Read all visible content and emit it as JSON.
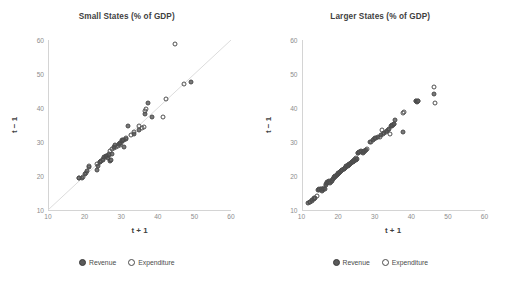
{
  "figure": {
    "panels": [
      {
        "id": "small-states",
        "title": "Small States (% of GDP)",
        "xlabel": "t + 1",
        "ylabel": "t − 1",
        "legend": [
          {
            "key": "revenue",
            "label": "Revenue",
            "marker": "filled-circle",
            "color": "#6d6d6d"
          },
          {
            "key": "expenditure",
            "label": "Expenditure",
            "marker": "open-circle",
            "color": "#4f4f4f"
          }
        ]
      },
      {
        "id": "larger-states",
        "title": "Larger States (% of GDP)",
        "xlabel": "t + 1",
        "ylabel": "t − 1",
        "legend": [
          {
            "key": "revenue",
            "label": "Revenue",
            "marker": "filled-circle",
            "color": "#6d6d6d"
          },
          {
            "key": "expenditure",
            "label": "Expenditure",
            "marker": "open-circle",
            "color": "#4f4f4f"
          }
        ]
      }
    ],
    "axis_ticks": {
      "x": [
        "10",
        "20",
        "30",
        "40",
        "50",
        "60"
      ],
      "y": [
        "10",
        "20",
        "30",
        "40",
        "50",
        "60"
      ]
    }
  },
  "chart_data": [
    {
      "type": "scatter",
      "title": "Small States (% of GDP)",
      "xlabel": "t + 1",
      "ylabel": "t − 1",
      "xlim": [
        10,
        60
      ],
      "ylim": [
        10,
        60
      ],
      "xticks": [
        10,
        20,
        30,
        40,
        50,
        60
      ],
      "yticks": [
        10,
        20,
        30,
        40,
        50,
        60
      ],
      "grid": false,
      "legend_position": "bottom",
      "reference_line": {
        "type": "45-degree",
        "from": [
          10,
          10
        ],
        "to": [
          60,
          60
        ],
        "color": "#d9d9d9"
      },
      "series": [
        {
          "name": "Revenue",
          "marker": "filled-circle",
          "color": "#6d6d6d",
          "points": [
            [
              18.6,
              19.3
            ],
            [
              19.4,
              19.4
            ],
            [
              20.1,
              20.5
            ],
            [
              20.6,
              21.6
            ],
            [
              21.3,
              22.6
            ],
            [
              23.3,
              21.9
            ],
            [
              23.6,
              23.0
            ],
            [
              24.2,
              24.0
            ],
            [
              24.6,
              24.4
            ],
            [
              25.1,
              24.6
            ],
            [
              25.4,
              25.6
            ],
            [
              25.8,
              25.9
            ],
            [
              26.1,
              26.0
            ],
            [
              26.3,
              25.4
            ],
            [
              26.6,
              26.2
            ],
            [
              26.9,
              24.5
            ],
            [
              27.1,
              24.6
            ],
            [
              27.6,
              26.5
            ],
            [
              28.1,
              28.5
            ],
            [
              28.4,
              29.2
            ],
            [
              29.3,
              29.4
            ],
            [
              29.8,
              29.6
            ],
            [
              30.1,
              30.3
            ],
            [
              30.4,
              30.7
            ],
            [
              30.8,
              28.6
            ],
            [
              31.2,
              30.9
            ],
            [
              31.9,
              34.6
            ],
            [
              33.4,
              32.4
            ],
            [
              34.8,
              33.4
            ],
            [
              36.4,
              38.2
            ],
            [
              37.3,
              41.4
            ],
            [
              38.4,
              37.4
            ],
            [
              49.2,
              47.6
            ]
          ]
        },
        {
          "name": "Expenditure",
          "marker": "open-circle",
          "color": "#4f4f4f",
          "points": [
            [
              18.6,
              19.3
            ],
            [
              19.5,
              19.6
            ],
            [
              20.3,
              21.0
            ],
            [
              21.1,
              22.8
            ],
            [
              23.4,
              23.5
            ],
            [
              24.3,
              24.1
            ],
            [
              25.0,
              25.1
            ],
            [
              25.6,
              25.5
            ],
            [
              26.0,
              25.9
            ],
            [
              26.6,
              26.4
            ],
            [
              27.0,
              27.5
            ],
            [
              27.5,
              27.9
            ],
            [
              28.0,
              28.1
            ],
            [
              28.6,
              28.4
            ],
            [
              29.1,
              28.8
            ],
            [
              29.6,
              29.1
            ],
            [
              30.0,
              29.7
            ],
            [
              30.3,
              30.5
            ],
            [
              30.9,
              30.6
            ],
            [
              31.3,
              31.1
            ],
            [
              32.7,
              32.0
            ],
            [
              33.6,
              33.0
            ],
            [
              34.9,
              34.6
            ],
            [
              35.6,
              34.0
            ],
            [
              36.1,
              34.3
            ],
            [
              36.6,
              39.0
            ],
            [
              36.9,
              39.6
            ],
            [
              41.4,
              37.5
            ],
            [
              42.3,
              42.6
            ],
            [
              44.7,
              58.9
            ],
            [
              47.2,
              47.1
            ]
          ]
        }
      ]
    },
    {
      "type": "scatter",
      "title": "Larger States (% of GDP)",
      "xlabel": "t + 1",
      "ylabel": "t − 1",
      "xlim": [
        10,
        60
      ],
      "ylim": [
        10,
        60
      ],
      "xticks": [
        10,
        20,
        30,
        40,
        50,
        60
      ],
      "yticks": [
        10,
        20,
        30,
        40,
        50,
        60
      ],
      "grid": false,
      "legend_position": "bottom",
      "reference_line": null,
      "series": [
        {
          "name": "Revenue",
          "marker": "filled-circle",
          "color": "#6d6d6d",
          "points": [
            [
              11.8,
              12.0
            ],
            [
              12.4,
              12.3
            ],
            [
              12.9,
              12.9
            ],
            [
              13.4,
              13.2
            ],
            [
              13.8,
              13.6
            ],
            [
              14.6,
              15.9
            ],
            [
              14.9,
              16.1
            ],
            [
              15.2,
              16.2
            ],
            [
              15.6,
              15.7
            ],
            [
              16.0,
              16.1
            ],
            [
              16.3,
              16.3
            ],
            [
              16.6,
              17.4
            ],
            [
              16.9,
              17.9
            ],
            [
              17.2,
              18.2
            ],
            [
              17.5,
              18.4
            ],
            [
              17.9,
              18.0
            ],
            [
              18.2,
              18.6
            ],
            [
              18.6,
              19.2
            ],
            [
              18.9,
              19.6
            ],
            [
              19.2,
              19.9
            ],
            [
              19.6,
              20.2
            ],
            [
              19.9,
              20.6
            ],
            [
              20.2,
              21.0
            ],
            [
              20.6,
              21.3
            ],
            [
              20.9,
              21.6
            ],
            [
              21.2,
              21.9
            ],
            [
              21.6,
              22.2
            ],
            [
              21.9,
              22.5
            ],
            [
              22.2,
              22.8
            ],
            [
              22.6,
              23.0
            ],
            [
              22.9,
              23.3
            ],
            [
              23.2,
              23.6
            ],
            [
              23.5,
              23.8
            ],
            [
              23.8,
              24.0
            ],
            [
              24.1,
              24.2
            ],
            [
              24.4,
              24.5
            ],
            [
              24.8,
              24.8
            ],
            [
              25.1,
              25.0
            ],
            [
              25.4,
              26.7
            ],
            [
              25.8,
              27.1
            ],
            [
              26.2,
              27.4
            ],
            [
              26.8,
              26.9
            ],
            [
              27.2,
              27.3
            ],
            [
              27.6,
              27.6
            ],
            [
              28.6,
              29.9
            ],
            [
              29.4,
              30.6
            ],
            [
              30.1,
              31.2
            ],
            [
              31.0,
              31.4
            ],
            [
              31.8,
              32.0
            ],
            [
              32.6,
              32.6
            ],
            [
              33.4,
              33.2
            ],
            [
              33.9,
              33.8
            ],
            [
              34.4,
              34.6
            ],
            [
              34.8,
              35.0
            ],
            [
              35.2,
              35.2
            ],
            [
              35.6,
              36.5
            ],
            [
              37.7,
              32.8
            ],
            [
              41.2,
              42.0
            ],
            [
              41.6,
              41.9
            ],
            [
              41.9,
              42.0
            ],
            [
              46.2,
              44.2
            ]
          ]
        },
        {
          "name": "Expenditure",
          "marker": "open-circle",
          "color": "#4f4f4f",
          "points": [
            [
              12.2,
              12.4
            ],
            [
              12.8,
              12.7
            ],
            [
              13.3,
              13.4
            ],
            [
              14.2,
              14.0
            ],
            [
              14.8,
              16.0
            ],
            [
              15.3,
              16.3
            ],
            [
              15.9,
              15.9
            ],
            [
              16.2,
              16.4
            ],
            [
              16.8,
              17.6
            ],
            [
              17.1,
              18.1
            ],
            [
              17.6,
              18.3
            ],
            [
              18.0,
              18.2
            ],
            [
              18.4,
              18.8
            ],
            [
              18.8,
              19.4
            ],
            [
              19.1,
              19.8
            ],
            [
              19.5,
              20.1
            ],
            [
              19.8,
              20.4
            ],
            [
              20.1,
              20.8
            ],
            [
              20.5,
              21.2
            ],
            [
              20.8,
              21.5
            ],
            [
              21.1,
              21.8
            ],
            [
              21.5,
              22.1
            ],
            [
              21.8,
              22.4
            ],
            [
              22.1,
              22.7
            ],
            [
              22.5,
              22.9
            ],
            [
              22.8,
              23.2
            ],
            [
              23.1,
              23.5
            ],
            [
              23.4,
              23.7
            ],
            [
              23.7,
              24.1
            ],
            [
              24.0,
              24.3
            ],
            [
              24.3,
              24.6
            ],
            [
              24.7,
              24.9
            ],
            [
              25.0,
              25.2
            ],
            [
              25.5,
              26.8
            ],
            [
              25.9,
              27.2
            ],
            [
              26.4,
              27.0
            ],
            [
              27.0,
              27.2
            ],
            [
              27.4,
              27.5
            ],
            [
              27.8,
              27.8
            ],
            [
              28.9,
              30.1
            ],
            [
              29.7,
              30.8
            ],
            [
              30.4,
              31.3
            ],
            [
              31.4,
              31.6
            ],
            [
              31.9,
              33.5
            ],
            [
              32.2,
              32.3
            ],
            [
              33.0,
              32.9
            ],
            [
              33.6,
              33.6
            ],
            [
              34.2,
              32.3
            ],
            [
              34.6,
              34.8
            ],
            [
              35.0,
              35.1
            ],
            [
              35.4,
              35.4
            ],
            [
              37.6,
              38.6
            ],
            [
              37.9,
              38.8
            ],
            [
              41.4,
              42.1
            ],
            [
              41.8,
              42.2
            ],
            [
              46.3,
              46.3
            ],
            [
              46.4,
              41.4
            ]
          ]
        }
      ]
    }
  ]
}
